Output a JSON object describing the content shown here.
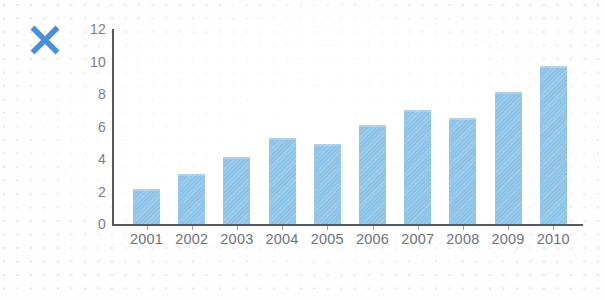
{
  "icons": {
    "close_mark": "x-mark",
    "close_mark_color": "#4a90d9"
  },
  "colors": {
    "bar": "#8ec3e8",
    "axis": "#545a60",
    "tick_text": "#75797f",
    "background": "#ffffff",
    "dot_grid": "#c3c9d6"
  },
  "chart_data": {
    "type": "bar",
    "title": "",
    "subtitle": "",
    "xlabel": "",
    "ylabel": "",
    "categories": [
      "2001",
      "2002",
      "2003",
      "2004",
      "2005",
      "2006",
      "2007",
      "2008",
      "2009",
      "2010"
    ],
    "values": [
      2.15,
      3.05,
      4.15,
      5.3,
      4.95,
      6.1,
      7.0,
      6.5,
      8.1,
      9.7
    ],
    "series": [
      {
        "name": "",
        "values": [
          2.15,
          3.05,
          4.15,
          5.3,
          4.95,
          6.1,
          7.0,
          6.5,
          8.1,
          9.7
        ]
      }
    ],
    "ylim": [
      0,
      12
    ],
    "ytick_values": [
      0,
      2,
      4,
      6,
      8,
      10,
      12
    ],
    "ytick_labels": [
      "0",
      "2",
      "4",
      "6",
      "8",
      "10",
      "12"
    ],
    "xtick_labels": [
      "2001",
      "2002",
      "2003",
      "2004",
      "2005",
      "2006",
      "2007",
      "2008",
      "2009",
      "2010"
    ],
    "grid": false,
    "legend": null,
    "legend_position": "none",
    "annotations": []
  }
}
